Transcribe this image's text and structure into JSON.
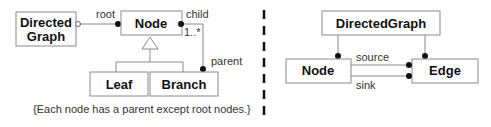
{
  "left_diagram": {
    "classes": {
      "directed_graph": [
        "Directed",
        "Graph"
      ],
      "node": "Node",
      "leaf": "Leaf",
      "branch": "Branch"
    },
    "roles": {
      "root": "root",
      "child": "child",
      "multiplicity": "1..*",
      "parent": "parent"
    },
    "constraint_note": "{Each node has a parent except root nodes.}"
  },
  "right_diagram": {
    "classes": {
      "directed_graph": "DirectedGraph",
      "node": "Node",
      "edge": "Edge"
    },
    "roles": {
      "source": "source",
      "sink": "sink"
    }
  },
  "colors": {
    "box_stroke": "#8a8a8a",
    "text": "#111111",
    "divider": "#111111"
  }
}
